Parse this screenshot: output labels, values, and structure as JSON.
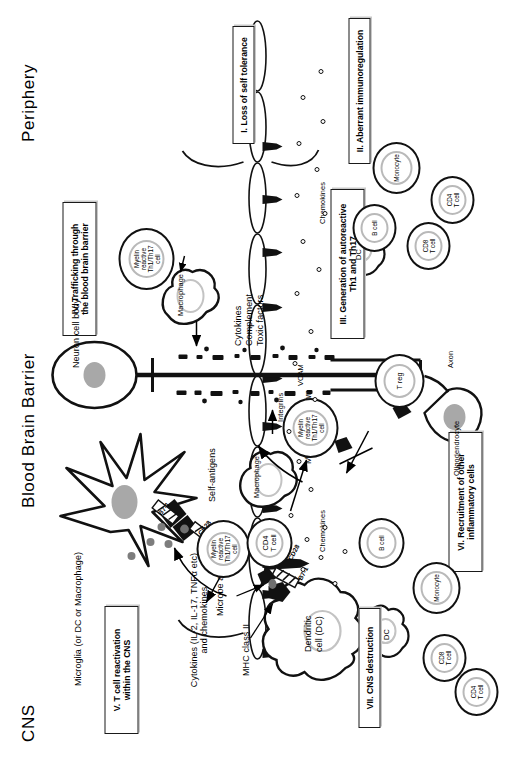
{
  "figure": {
    "compartments": [
      {
        "id": "periphery",
        "label": "Periphery"
      },
      {
        "id": "bbb",
        "label": "Blood Brain Barrier"
      },
      {
        "id": "cns",
        "label": "CNS"
      }
    ],
    "steps": [
      {
        "numeral": "I.",
        "label": "I. Loss of self tolerance"
      },
      {
        "numeral": "II.",
        "label": "II. Aberrant immunoregulation"
      },
      {
        "numeral": "III.",
        "label": "III.  Generation of autoreactive\nTh1 and  Th17"
      },
      {
        "numeral": "IV.",
        "label": "IV. Trafficking through\nthe blood brain barrier"
      },
      {
        "numeral": "V.",
        "label": "V. T cell reactivation\nwithin the CNS"
      },
      {
        "numeral": "VI.",
        "label": "VI. Recruitment of other\ninflammatory cells"
      },
      {
        "numeral": "VII.",
        "label": "VII. CNS destruction"
      }
    ],
    "periphery": {
      "dendritic_cell": "Dendritic\ncell (DC)",
      "mhc_class_ii": "MHC class II",
      "microbe_antigen": "Microbe antigen",
      "b7_1": "B7-1",
      "cd28": "CD28",
      "cd4_t_cell": "CD4\nT cell",
      "treg": "T reg",
      "myelin_reactive_cell": "Myelin\nreactive\nTh1/Th17\ncell",
      "integrins": "Integrins",
      "inflammatory_pool": [
        {
          "name": "DC",
          "label": "DC"
        },
        {
          "name": "monocyte",
          "label": "Monocyte"
        },
        {
          "name": "b-cell",
          "label": "B cell"
        },
        {
          "name": "cd8-t-cell",
          "label": "CD8\nT cell"
        },
        {
          "name": "cd4-t-cell",
          "label": "CD4\nT cell"
        }
      ]
    },
    "bbb": {
      "icam": "ICAM",
      "vcam": "VCAM",
      "chemokines": "Chemokines",
      "myelin_reactive_cell": "Myelin\nreactive\nTh1/Th17\ncell"
    },
    "cns": {
      "microglia": "Microglia (or DC or Macrophage)",
      "self_antigens": "Self-antigens",
      "b7_1": "B7-1",
      "cd28": "CD28",
      "myelin_reactive_cell": "Myelin\nreactive\nTh1/Th17\ncell",
      "cytokines_release": "Cytokines (IL-2, IL-17, TNFα etc)\nand chemokines",
      "macrophage": "Macrophage",
      "macrophage_2": "Macrophage",
      "oligodendrocyte": "Oligodendrocyte",
      "axon": "Axon",
      "myelin_breakdown": "Myelin breakdown",
      "neuron_cell_body": "Neuron cell body",
      "effectors": "Cytokines\nComplement\nToxic factors",
      "chemokines": "Chemokines",
      "recruited_cells": [
        {
          "name": "cd8-t-cell",
          "label": "CD8\nT cell"
        },
        {
          "name": "cd4-t-cell",
          "label": "CD4\nT cell"
        },
        {
          "name": "dc",
          "label": "DC"
        },
        {
          "name": "monocyte",
          "label": "Monocyte"
        },
        {
          "name": "b-cell",
          "label": "B cell"
        }
      ]
    },
    "colors": {
      "ink": "#000000",
      "outline": "#111111",
      "nucleus": "#b9b9b9",
      "grey_fill": "#9a9a9a",
      "background": "#ffffff"
    }
  }
}
